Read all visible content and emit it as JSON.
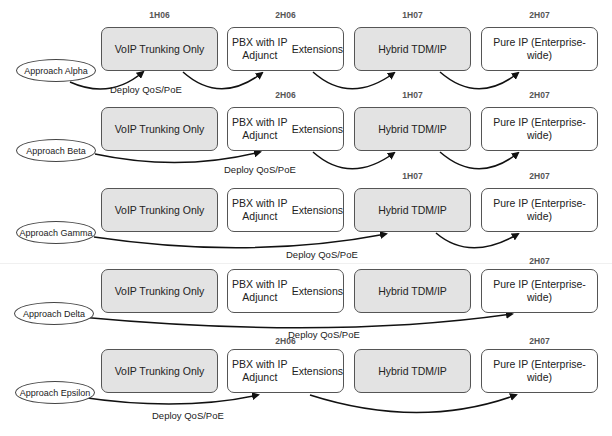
{
  "stages": [
    "VoIP Trunking Only",
    "PBX with IP Adjunct Extensions",
    "Hybrid TDM/IP",
    "Pure IP (Enterprise-wide)"
  ],
  "stage_lines": [
    [
      "VoIP Trunking Only"
    ],
    [
      "PBX with IP Adjunct",
      "Extensions"
    ],
    [
      "Hybrid TDM/IP"
    ],
    [
      "Pure IP (Enterprise-wide)"
    ]
  ],
  "colors": {
    "shaded_fill": "#e3e3e3",
    "border": "#555555",
    "arrow": "#111111",
    "date_text": "#555555"
  },
  "rows": [
    {
      "approach": "Approach Alpha",
      "action": "Deploy QoS/PoE",
      "dates": [
        "1H06",
        "2H06",
        "1H07",
        "2H07"
      ],
      "path": [
        "approach",
        "VoIP Trunking Only",
        "PBX with IP Adjunct Extensions",
        "Hybrid TDM/IP",
        "Pure IP (Enterprise-wide)"
      ]
    },
    {
      "approach": "Approach Beta",
      "action": "Deploy QoS/PoE",
      "dates": [
        "",
        "2H06",
        "1H07",
        "2H07"
      ],
      "path": [
        "approach",
        "PBX with IP Adjunct Extensions",
        "Hybrid TDM/IP",
        "Pure IP (Enterprise-wide)"
      ]
    },
    {
      "approach": "Approach Gamma",
      "action": "Deploy QoS/PoE",
      "dates": [
        "",
        "",
        "1H07",
        "2H07"
      ],
      "path": [
        "approach",
        "Hybrid TDM/IP",
        "Pure IP (Enterprise-wide)"
      ]
    },
    {
      "approach": "Approach Delta",
      "action": "Deploy QoS/PoE",
      "dates": [
        "",
        "",
        "",
        "2H07"
      ],
      "path": [
        "approach",
        "Pure IP (Enterprise-wide)"
      ]
    },
    {
      "approach": "Approach Epsilon",
      "action": "Deploy QoS/PoE",
      "dates": [
        "",
        "2H06",
        "",
        "2H07"
      ],
      "path": [
        "approach",
        "PBX with IP Adjunct Extensions",
        "Pure IP (Enterprise-wide)"
      ]
    }
  ]
}
